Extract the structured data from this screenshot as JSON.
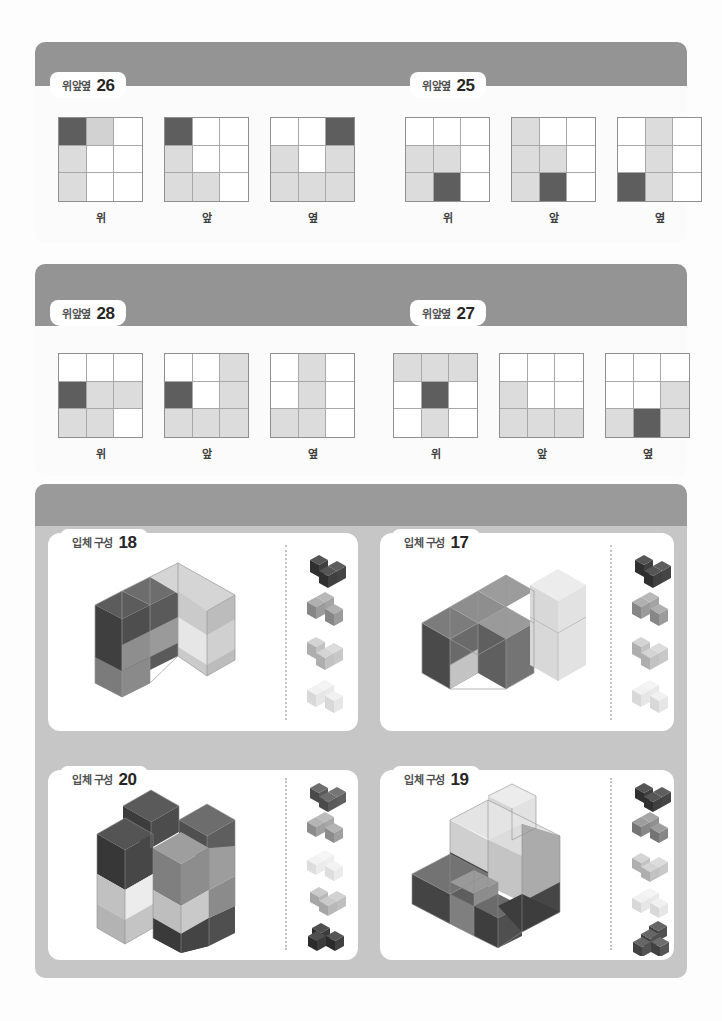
{
  "page": {
    "background": "#fdfdfd",
    "panel_color": "#9a9a9a",
    "panel_light": "#c6c6c6"
  },
  "palette": {
    "cell_white": "#ffffff",
    "cell_light": "#dcdcdc",
    "cell_mid": "#d2d2d2",
    "cell_dark": "#5e5e5e",
    "cube_darkest": "#3f3f3f",
    "cube_dark": "#6e6e6e",
    "cube_mid": "#a3a3a3",
    "cube_light": "#cfcfcf",
    "cube_lightest": "#ebebeb"
  },
  "view_labels": {
    "top": "위",
    "front": "앞",
    "side": "옆"
  },
  "sections": [
    {
      "id": "section-views-a",
      "puzzles": [
        {
          "tab_name": "위앞옆",
          "tab_number": "26",
          "grids": [
            {
              "label": "위",
              "cells": [
                "d",
                "m",
                "w",
                "l",
                "w",
                "w",
                "l",
                "w",
                "w"
              ]
            },
            {
              "label": "앞",
              "cells": [
                "d",
                "w",
                "w",
                "l",
                "w",
                "w",
                "l",
                "l",
                "w"
              ]
            },
            {
              "label": "옆",
              "cells": [
                "w",
                "w",
                "d",
                "l",
                "w",
                "l",
                "l",
                "l",
                "l"
              ]
            }
          ]
        },
        {
          "tab_name": "위앞옆",
          "tab_number": "25",
          "grids": [
            {
              "label": "위",
              "cells": [
                "w",
                "w",
                "w",
                "l",
                "l",
                "w",
                "l",
                "d",
                "w"
              ]
            },
            {
              "label": "앞",
              "cells": [
                "l",
                "w",
                "w",
                "l",
                "l",
                "w",
                "l",
                "d",
                "w"
              ]
            },
            {
              "label": "옆",
              "cells": [
                "w",
                "l",
                "w",
                "w",
                "l",
                "w",
                "d",
                "l",
                "w"
              ]
            }
          ]
        }
      ]
    },
    {
      "id": "section-views-b",
      "puzzles": [
        {
          "tab_name": "위앞옆",
          "tab_number": "28",
          "grids": [
            {
              "label": "위",
              "cells": [
                "w",
                "w",
                "w",
                "d",
                "l",
                "l",
                "l",
                "l",
                "w"
              ]
            },
            {
              "label": "앞",
              "cells": [
                "w",
                "w",
                "l",
                "d",
                "w",
                "l",
                "l",
                "l",
                "l"
              ]
            },
            {
              "label": "옆",
              "cells": [
                "w",
                "l",
                "w",
                "w",
                "l",
                "w",
                "l",
                "l",
                "w"
              ]
            }
          ]
        },
        {
          "tab_name": "위앞옆",
          "tab_number": "27",
          "grids": [
            {
              "label": "위",
              "cells": [
                "l",
                "l",
                "l",
                "w",
                "d",
                "w",
                "w",
                "l",
                "w"
              ]
            },
            {
              "label": "앞",
              "cells": [
                "w",
                "w",
                "w",
                "l",
                "w",
                "w",
                "l",
                "l",
                "l"
              ]
            },
            {
              "label": "옆",
              "cells": [
                "w",
                "w",
                "w",
                "w",
                "w",
                "l",
                "l",
                "d",
                "l"
              ]
            }
          ]
        }
      ]
    },
    {
      "id": "section-solids",
      "puzzles": [
        {
          "tab_name": "입체 구성",
          "tab_number": "18",
          "piece_count": 4,
          "piece_shades": [
            "#3f3f3f",
            "#8f8f8f",
            "#c2c2c2",
            "#e8e8e8"
          ]
        },
        {
          "tab_name": "입체 구성",
          "tab_number": "17",
          "piece_count": 4,
          "piece_shades": [
            "#3f3f3f",
            "#8f8f8f",
            "#c2c2c2",
            "#e8e8e8"
          ]
        },
        {
          "tab_name": "입체 구성",
          "tab_number": "20",
          "piece_count": 5,
          "piece_shades": [
            "#5a5a5a",
            "#9a9a9a",
            "#ececec",
            "#bdbdbd",
            "#3a3a3a"
          ]
        },
        {
          "tab_name": "입체 구성",
          "tab_number": "19",
          "piece_count": 5,
          "piece_shades": [
            "#3f3f3f",
            "#7a7a7a",
            "#bdbdbd",
            "#e8e8e8",
            "#555555"
          ]
        }
      ]
    }
  ]
}
